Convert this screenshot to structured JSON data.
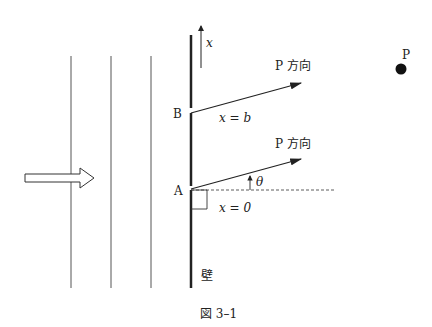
{
  "figure": {
    "caption": "図 3–1",
    "wall_label": "壁",
    "axis_label": "x",
    "point_label": "P",
    "slit_b": {
      "name": "B",
      "coord_label": "x = b",
      "direction_label": "P 方向"
    },
    "slit_a": {
      "name": "A",
      "coord_label": "x = 0",
      "direction_label": "P 方向"
    },
    "angle_label": "θ",
    "incident_wavefronts": 3,
    "colors": {
      "line": "#222222",
      "wavefront": "#555555"
    }
  }
}
